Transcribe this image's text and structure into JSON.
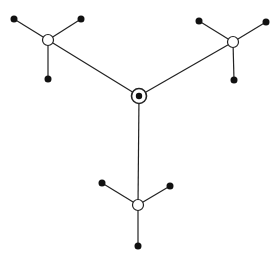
{
  "diagram": {
    "type": "tree-network",
    "width": 280,
    "height": 257,
    "colors": {
      "background": "#ffffff",
      "stroke": "#222222",
      "filled_node": "#111111",
      "hollow_node_fill": "#ffffff"
    },
    "center": {
      "id": "root",
      "x": 139,
      "y": 96,
      "style": "target",
      "outer_r": 7.5,
      "inner_r": 3.2
    },
    "hubs": [
      {
        "id": "hub-left",
        "x": 48,
        "y": 40,
        "r": 5.5,
        "leaves": [
          {
            "id": "leaf-left-1",
            "x": 14,
            "y": 19
          },
          {
            "id": "leaf-left-2",
            "x": 81,
            "y": 19
          },
          {
            "id": "leaf-left-3",
            "x": 48,
            "y": 79
          }
        ]
      },
      {
        "id": "hub-right",
        "x": 233,
        "y": 42,
        "r": 5.5,
        "leaves": [
          {
            "id": "leaf-right-1",
            "x": 199,
            "y": 21
          },
          {
            "id": "leaf-right-2",
            "x": 266,
            "y": 22
          },
          {
            "id": "leaf-right-3",
            "x": 234,
            "y": 80
          }
        ]
      },
      {
        "id": "hub-bottom",
        "x": 138,
        "y": 205,
        "r": 5.5,
        "leaves": [
          {
            "id": "leaf-bottom-1",
            "x": 102,
            "y": 183
          },
          {
            "id": "leaf-bottom-2",
            "x": 170,
            "y": 186
          },
          {
            "id": "leaf-bottom-3",
            "x": 138,
            "y": 246
          }
        ]
      }
    ],
    "leaf_radius": 3.5
  }
}
